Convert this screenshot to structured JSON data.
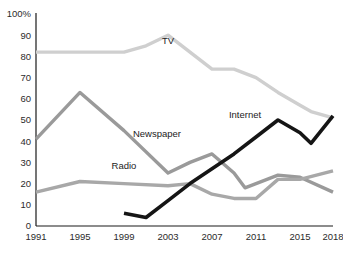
{
  "chart_data": {
    "type": "line",
    "title": "",
    "xlabel": "",
    "ylabel": "",
    "xlim": [
      1991,
      2018
    ],
    "ylim": [
      0,
      100
    ],
    "grid": false,
    "legend_position": "inline-labels",
    "y_ticks": [
      "0",
      "10",
      "20",
      "30",
      "40",
      "50",
      "60",
      "70",
      "80",
      "90",
      "100%"
    ],
    "y_tick_values": [
      0,
      10,
      20,
      30,
      40,
      50,
      60,
      70,
      80,
      90,
      100
    ],
    "x_ticks": [
      "1991",
      "1995",
      "1999",
      "2003",
      "2007",
      "2011",
      "2015",
      "2018"
    ],
    "x_tick_values": [
      1991,
      1995,
      1999,
      2003,
      2007,
      2011,
      2015,
      2018
    ],
    "series": [
      {
        "name": "TV",
        "color": "#cfcfcf",
        "stroke_width": 3.4,
        "label_x": 2003,
        "label_y": 86,
        "x": [
          1991,
          1995,
          1999,
          2001,
          2003,
          2005,
          2007,
          2009,
          2011,
          2013,
          2015,
          2016,
          2018
        ],
        "values": [
          82,
          82,
          82,
          85,
          90,
          82,
          74,
          74,
          70,
          63,
          57,
          54,
          51
        ]
      },
      {
        "name": "Newspaper",
        "color": "#9a9a9a",
        "stroke_width": 3.4,
        "label_x": 2002,
        "label_y": 42,
        "x": [
          1991,
          1995,
          1999,
          2003,
          2005,
          2007,
          2009,
          2010,
          2011,
          2013,
          2015,
          2018
        ],
        "values": [
          41,
          63,
          45,
          25,
          30,
          34,
          25,
          18,
          20,
          24,
          23,
          16
        ]
      },
      {
        "name": "Radio",
        "color": "#a8a8a8",
        "stroke_width": 3.4,
        "label_x": 1999,
        "label_y": 27,
        "x": [
          1991,
          1995,
          1999,
          2003,
          2005,
          2007,
          2009,
          2011,
          2013,
          2015,
          2018
        ],
        "values": [
          16,
          21,
          20,
          19,
          20,
          15,
          13,
          13,
          22,
          22,
          26
        ]
      },
      {
        "name": "Internet",
        "color": "#151515",
        "stroke_width": 3.6,
        "label_x": 2010,
        "label_y": 51,
        "x": [
          1999,
          2001,
          2003,
          2005,
          2007,
          2009,
          2011,
          2013,
          2015,
          2016,
          2018
        ],
        "values": [
          6,
          4,
          12,
          20,
          27,
          34,
          42,
          50,
          44,
          39,
          52
        ]
      }
    ]
  },
  "axis": {
    "y_axis_name": "percent-axis",
    "x_axis_name": "year-axis"
  }
}
